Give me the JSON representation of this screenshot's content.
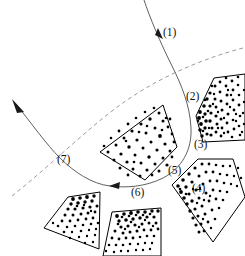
{
  "figure": {
    "width": 245,
    "height": 256,
    "background_color": "#ffffff",
    "outline_color": "#000000",
    "speck_color": "#000000",
    "flow_curve_color": "#4d4d4d",
    "dashed_curve_color": "#8e8e8e"
  },
  "labels": [
    {
      "id": "label-1",
      "text": "(1)",
      "x": 163,
      "y": 36
    },
    {
      "id": "label-2",
      "text": "(2)",
      "x": 186,
      "y": 100
    },
    {
      "id": "label-3",
      "text": "(3)",
      "x": 194,
      "y": 148
    },
    {
      "id": "label-4",
      "text": "(4)",
      "x": 192,
      "y": 192
    },
    {
      "id": "label-5",
      "text": "(5)",
      "x": 168,
      "y": 174
    },
    {
      "id": "label-6",
      "text": "(6)",
      "x": 131,
      "y": 196
    },
    {
      "id": "label-7",
      "text": "(7)",
      "x": 57,
      "y": 163
    }
  ],
  "regions": [
    {
      "id": "region-center",
      "name": "center-polygon",
      "points": "100,152 163,105 177,147 145,180",
      "speck_count": 52,
      "speck_size": "mixed"
    },
    {
      "id": "region-upper-right",
      "name": "upper-right-wedge",
      "points": "196,115 212,79 245,76 245,139 202,141",
      "speck_count": 74,
      "speck_size": "mixed"
    },
    {
      "id": "region-right-lower",
      "name": "lower-right-wedge",
      "points": "172,184 197,160 232,160 245,196 214,241",
      "speck_count": 62,
      "speck_size": "mixed"
    },
    {
      "id": "region-bottom-center",
      "name": "bottom-center-wedge",
      "points": "112,212 160,208 160,256 104,256",
      "speck_count": 58,
      "speck_size": "mixed"
    },
    {
      "id": "region-bottom-left",
      "name": "bottom-left-wedge",
      "points": "68,197 99,192 98,248 44,228",
      "speck_count": 44,
      "speck_size": "mixed"
    }
  ],
  "curves": [
    {
      "id": "flow-streamline",
      "name": "flow-streamline",
      "style": "solid",
      "description": "streamline entering from top, wrapping around right and bottom of the center region, exiting to upper left"
    },
    {
      "id": "dashed-boundary",
      "name": "dashed-boundary-arc",
      "style": "dashed",
      "description": "dashed arc from upper right to lower left"
    }
  ],
  "arrows": [
    {
      "id": "arrow-top",
      "name": "arrow-top",
      "x": 158,
      "y": 31,
      "angle": 105
    },
    {
      "id": "arrow-left",
      "name": "arrow-left",
      "x": 15,
      "y": 103,
      "angle": 222
    },
    {
      "id": "arrow-bottom",
      "name": "arrow-bottom",
      "x": 114,
      "y": 186,
      "angle": 188
    }
  ]
}
